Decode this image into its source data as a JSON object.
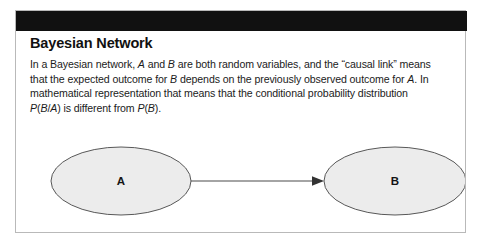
{
  "figure": {
    "title": "Bayesian Network",
    "header_bar_color": "#111111",
    "frame_border_color": "#b9b9b9",
    "background_color": "#ffffff"
  },
  "body": {
    "line1_a": "In a Bayesian network, ",
    "line1_var1": "A",
    "line1_b": " and ",
    "line1_var2": "B",
    "line1_c": " are both random variables, and the “causal link” means",
    "line2_a": "that the expected outcome for ",
    "line2_var1": "B",
    "line2_b": " depends on the previously observed outcome for ",
    "line2_var2": "A",
    "line2_c": ". In",
    "line3": "mathematical representation that means that the conditional probability distribution",
    "line4_var1": "P",
    "line4_a": "(",
    "line4_var2": "B",
    "line4_b": "/",
    "line4_var3": "A",
    "line4_c": ") is different from ",
    "line4_var4": "P",
    "line4_d": "(",
    "line4_var5": "B",
    "line4_e": ")."
  },
  "graph": {
    "node_fill": "#ececec",
    "node_stroke": "#585858",
    "edge_color": "#4a4a4a",
    "nodes": [
      {
        "id": "A",
        "label": "A",
        "cx": 105,
        "cy": 52,
        "rx": 70,
        "ry": 34
      },
      {
        "id": "B",
        "label": "B",
        "cx": 379,
        "cy": 52,
        "rx": 71,
        "ry": 34
      }
    ],
    "edges": [
      {
        "from": "A",
        "to": "B",
        "label": "",
        "arrowhead": "solid-triangle"
      }
    ]
  }
}
